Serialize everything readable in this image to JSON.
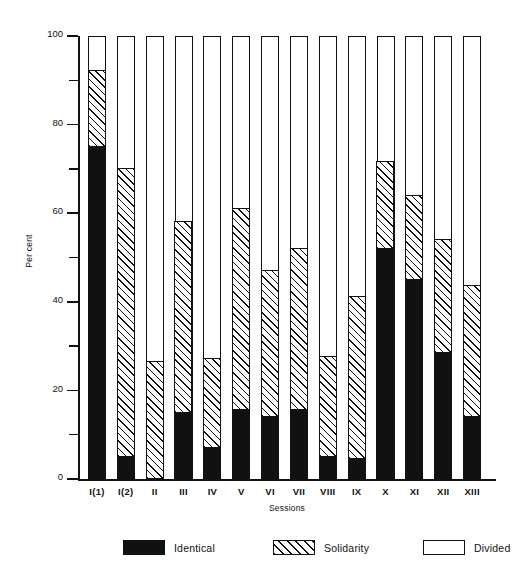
{
  "chart_data": {
    "type": "bar",
    "subtype": "stacked-100-percent",
    "title": "",
    "xlabel": "Sessions",
    "ylabel": "Per cent",
    "ylim": [
      0,
      100
    ],
    "y_major_ticks": [
      0,
      20,
      40,
      60,
      80,
      100
    ],
    "y_minor_ticks": [
      10,
      30,
      50,
      70,
      90
    ],
    "y_tick_labels": [
      "0",
      "20",
      "40",
      "60",
      "80",
      "100"
    ],
    "grid": false,
    "legend_position": "bottom",
    "categories": [
      "I(1)",
      "I(2)",
      "II",
      "III",
      "IV",
      "V",
      "VI",
      "VII",
      "VIII",
      "IX",
      "X",
      "XI",
      "XII",
      "XIII"
    ],
    "series": [
      {
        "name": "Identical",
        "color": "#111111",
        "pattern": "solid",
        "values": [
          75,
          5,
          0,
          15,
          7,
          15.5,
          14,
          15.5,
          5,
          4.5,
          52,
          45,
          28.5,
          14
        ]
      },
      {
        "name": "Solidarity",
        "color": "#111111",
        "pattern": "diagonal-hatch-45",
        "values": [
          17,
          65,
          26.5,
          43,
          20,
          45.5,
          33,
          36.5,
          22.5,
          36.5,
          19.5,
          19,
          25.5,
          29.5
        ]
      },
      {
        "name": "Divided",
        "color": "#ffffff",
        "pattern": "none",
        "values": [
          8,
          30,
          73.5,
          42,
          73,
          39,
          53,
          48,
          72.5,
          59,
          28.5,
          36,
          46,
          56.5
        ]
      }
    ],
    "cumulative_tops": {
      "identical": [
        75,
        5,
        0,
        15,
        7,
        15.5,
        14,
        15.5,
        5,
        4.5,
        52,
        45,
        28.5,
        14
      ],
      "solidarity": [
        92,
        70,
        26.5,
        58,
        27,
        61,
        47,
        52,
        27.5,
        41,
        71.5,
        64,
        54,
        43.5
      ],
      "divided": [
        100,
        100,
        100,
        100,
        100,
        100,
        100,
        100,
        100,
        100,
        100,
        100,
        100,
        100
      ]
    }
  },
  "legend": {
    "items": [
      {
        "label": "Identical"
      },
      {
        "label": "Solidarity"
      },
      {
        "label": "Divided"
      }
    ]
  }
}
